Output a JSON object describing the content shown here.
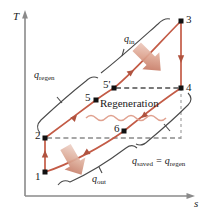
{
  "figure": {
    "type": "ts-diagram",
    "axes": {
      "y_label": "T",
      "x_label": "s"
    },
    "state_points": [
      {
        "id": "1",
        "label": "1",
        "x": 45,
        "y": 172
      },
      {
        "id": "2",
        "label": "2",
        "x": 45,
        "y": 138
      },
      {
        "id": "3",
        "label": "3",
        "x": 181,
        "y": 21
      },
      {
        "id": "4",
        "label": "4",
        "x": 181,
        "y": 88
      },
      {
        "id": "5",
        "label": "5",
        "x": 96,
        "y": 100
      },
      {
        "id": "5prime",
        "label": "5'",
        "x": 114,
        "y": 88
      },
      {
        "id": "6",
        "label": "6",
        "x": 124,
        "y": 131
      }
    ],
    "annotations": {
      "q_in": "q",
      "q_in_sub": "in",
      "q_out": "q",
      "q_out_sub": "out",
      "q_regen": "q",
      "q_regen_sub": "regen",
      "q_saved": "q",
      "q_saved_sub": "saved",
      "equals": " = ",
      "q_saved_rhs": "q",
      "q_saved_rhs_sub": "regen",
      "regeneration": "Regeneration"
    },
    "colors": {
      "curve": "#c35b46",
      "curve_light": "#d98b76",
      "axis": "#8a8a8a",
      "bracket": "#4a4a4a",
      "dashed": "#6b6b6b",
      "point": "#111111",
      "arrow_fill": "#c9705c",
      "wavy": "#e0a18f",
      "text": "#1a1a1a"
    }
  }
}
